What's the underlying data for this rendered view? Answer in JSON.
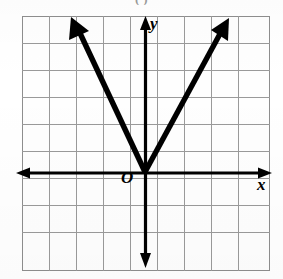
{
  "caption": {
    "fragment_text": "(     ) "
  },
  "figure": {
    "origin_label": "O",
    "x_axis_label": "x",
    "y_axis_label": "y"
  },
  "chart_data": {
    "type": "line",
    "title": "",
    "subtitle": "",
    "xlabel": "x",
    "ylabel": "y",
    "grid": true,
    "legend": null,
    "origin_label": "O",
    "axis_style": "arrows-both-ends",
    "grid_cells_x": 9,
    "grid_cells_y": 9,
    "grid_cell_px": 27,
    "xlim": [
      -5,
      4
    ],
    "ylim": [
      -4,
      5
    ],
    "x_tick_labels": [],
    "y_tick_labels": [],
    "series": [
      {
        "name": "left-branch",
        "points": [
          [
            -2.7,
            5.7
          ],
          [
            0,
            0
          ]
        ],
        "slope": -2.1,
        "arrow_at": "start"
      },
      {
        "name": "right-branch",
        "points": [
          [
            0,
            0
          ],
          [
            3.1,
            5.7
          ]
        ],
        "slope": 1.85,
        "arrow_at": "end"
      }
    ],
    "vertex": [
      0,
      0
    ]
  }
}
